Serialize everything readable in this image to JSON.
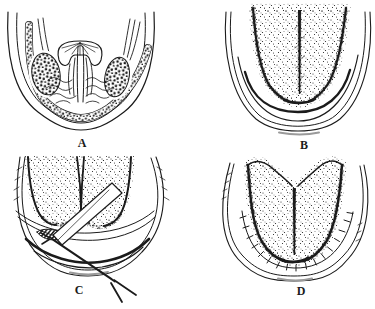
{
  "figure": {
    "background_color": "#ffffff",
    "ink_color": "#1b1b1b",
    "panels": [
      {
        "id": "panel-a",
        "label": "A"
      },
      {
        "id": "panel-b",
        "label": "B"
      },
      {
        "id": "panel-c",
        "label": "C"
      },
      {
        "id": "panel-d",
        "label": "D"
      }
    ]
  }
}
